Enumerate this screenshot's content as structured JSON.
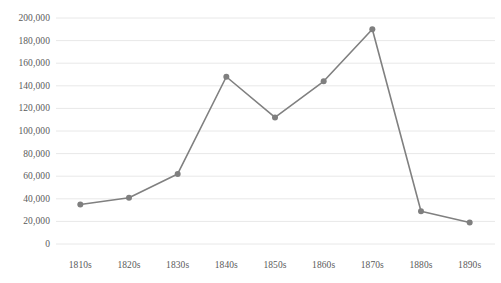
{
  "chart_data": {
    "type": "line",
    "title": "",
    "subtitle": "",
    "xlabel": "",
    "ylabel": "",
    "categories": [
      "1810s",
      "1820s",
      "1830s",
      "1840s",
      "1850s",
      "1860s",
      "1870s",
      "1880s",
      "1890s"
    ],
    "values": [
      35000,
      41000,
      62000,
      148000,
      112000,
      144000,
      190000,
      29000,
      19000
    ],
    "series": [
      {
        "name": "",
        "values": [
          35000,
          41000,
          62000,
          148000,
          112000,
          144000,
          190000,
          29000,
          19000
        ]
      }
    ],
    "ylim": [
      0,
      200000
    ],
    "ytick_values": [
      0,
      20000,
      40000,
      60000,
      80000,
      100000,
      120000,
      140000,
      160000,
      180000,
      200000
    ],
    "ytick_labels": [
      "0",
      "20,000",
      "40,000",
      "60,000",
      "80,000",
      "100,000",
      "120,000",
      "140,000",
      "160,000",
      "180,000",
      "200,000"
    ],
    "grid": {
      "horizontal": true,
      "vertical": false,
      "color": "#e8e8e8"
    },
    "legend": {
      "visible": false,
      "position": "none",
      "entries": []
    },
    "annotations": [],
    "style": {
      "line_color": "#808080",
      "marker_color": "#7f7f7f",
      "marker_shape": "circle",
      "background_color": "#ffffff",
      "axis_label_color": "#5a5a5a"
    }
  }
}
